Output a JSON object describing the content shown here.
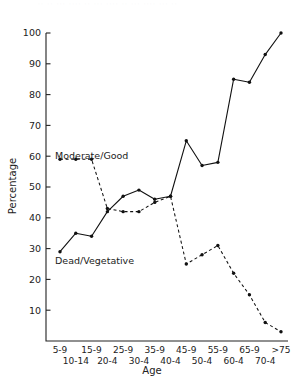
{
  "figure": {
    "artifact_text": "·· ·· ··· ···· ·· ··· ···· ·· ··· ···· ··· ··",
    "xlabel": "Age",
    "ylabel": "Percentage"
  },
  "chart_data": {
    "type": "line",
    "title": "",
    "xlabel": "Age",
    "ylabel": "Percentage",
    "ylim": [
      0,
      100
    ],
    "yticks": [
      10,
      20,
      30,
      40,
      50,
      60,
      70,
      80,
      90,
      100
    ],
    "grid": false,
    "legend": "inline-labels",
    "categories": [
      "5-9",
      "10-14",
      "15-9",
      "20-4",
      "25-9",
      "30-4",
      "35-9",
      "40-4",
      "45-9",
      "50-4",
      "55-9",
      "60-4",
      "65-9",
      "70-4",
      ">75"
    ],
    "xtick_rows": {
      "top": [
        "5-9",
        "15-9",
        "25-9",
        "35-9",
        "45-9",
        "55-9",
        "65-9",
        ">75"
      ],
      "bottom": [
        "10-14",
        "20-4",
        "30-4",
        "40-4",
        "50-4",
        "60-4",
        "70-4"
      ]
    },
    "series": [
      {
        "name": "Dead/Vegetative",
        "style": "solid",
        "marker": "filled-circle",
        "label_x": "5-9",
        "values": [
          29,
          35,
          34,
          42,
          47,
          49,
          46,
          47,
          65,
          57,
          58,
          85,
          84,
          93,
          100
        ]
      },
      {
        "name": "Moderate/Good",
        "style": "dashed",
        "marker": "filled-circle",
        "label_x": "15-9",
        "values": [
          59,
          59,
          59,
          43,
          42,
          42,
          45,
          47,
          25,
          28,
          31,
          22,
          15,
          6,
          3
        ]
      }
    ]
  }
}
